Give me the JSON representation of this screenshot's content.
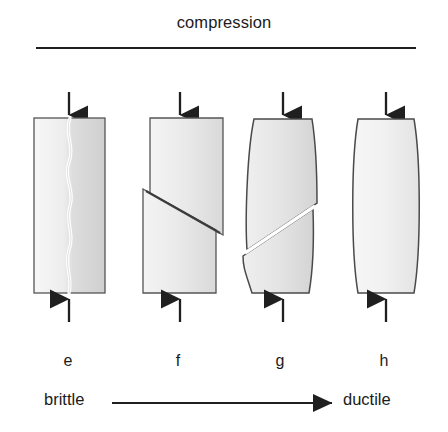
{
  "figure": {
    "title": "compression",
    "axis_left_label": "brittle",
    "axis_right_label": "ductile",
    "labels": {
      "e": "e",
      "f": "f",
      "g": "g",
      "h": "h"
    },
    "colors": {
      "ink": "#1f1f1f",
      "outline": "#4a4a4a",
      "fill_light": "#f2f2f2",
      "fill_mid": "#e2e2e2",
      "fill_dark": "#d2d2d2",
      "crack": "#ffffff",
      "background": "#ffffff"
    },
    "specimens": [
      {
        "id": "e",
        "label": "e",
        "shape": "rectangular-prism",
        "failure_mode": "axial-splitting",
        "fracture": "vertical wavy crack",
        "load_arrows": 2
      },
      {
        "id": "f",
        "label": "f",
        "shape": "rectangular-prism",
        "failure_mode": "single-shear",
        "fracture": "inclined shear plane with offset halves",
        "load_arrows": 2
      },
      {
        "id": "g",
        "label": "g",
        "shape": "barrelled",
        "failure_mode": "shear-with-barrelling",
        "fracture": "inclined open shear plane",
        "load_arrows": 2
      },
      {
        "id": "h",
        "label": "h",
        "shape": "barrelled",
        "failure_mode": "ductile-barrelling",
        "fracture": "none",
        "load_arrows": 2
      }
    ]
  }
}
